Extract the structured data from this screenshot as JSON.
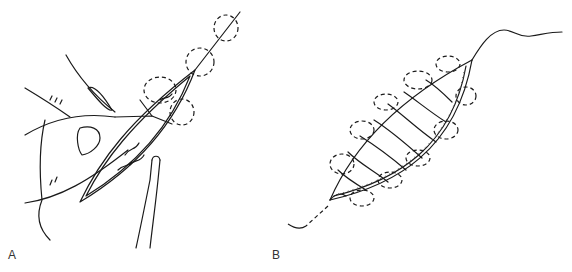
{
  "figure": {
    "panels": [
      {
        "id": "A",
        "label": "A",
        "description": "Hand holding wound edge with forceps; needle passing through wound with dashed suture loops along edge"
      },
      {
        "id": "B",
        "label": "B",
        "description": "Elliptical wound closed with continuous suture; dashed loops along both edges, dashed tail at lower left, wavy thread at upper right"
      }
    ]
  },
  "colors": {
    "line": "#1a1a1a",
    "label": "#333333",
    "background": "#ffffff"
  }
}
